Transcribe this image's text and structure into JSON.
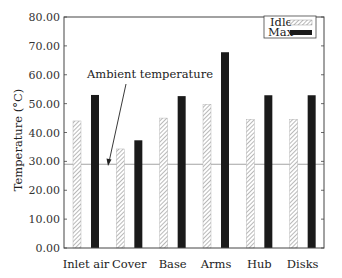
{
  "chart_data": {
    "type": "bar",
    "title": "",
    "xlabel": "",
    "ylabel": "Temperature (°C)",
    "ylim": [
      0,
      80
    ],
    "yticks": [
      "0.00",
      "10.00",
      "20.00",
      "30.00",
      "40.00",
      "50.00",
      "60.00",
      "70.00",
      "80.00"
    ],
    "categories": [
      "Inlet air",
      "Cover",
      "Base",
      "Arms",
      "Hub",
      "Disks"
    ],
    "series": [
      {
        "name": "Idle",
        "style": "hatched",
        "color": "#9a9a9a",
        "values": [
          44.0,
          34.3,
          45.0,
          49.8,
          44.6,
          44.6
        ]
      },
      {
        "name": "Max",
        "style": "solid",
        "color": "#1a1a1a",
        "values": [
          53.0,
          37.3,
          52.6,
          67.8,
          52.9,
          52.9
        ]
      }
    ],
    "reference_line": {
      "label": "Ambient temperature",
      "value": 29,
      "color": "#999999"
    },
    "legend_position": "top-right",
    "grid": false
  }
}
